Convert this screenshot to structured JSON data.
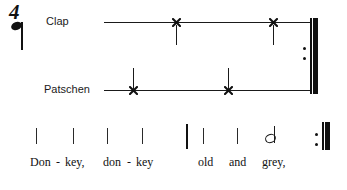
{
  "score": {
    "time_signature": {
      "numerator": "4",
      "beat_note": "quarter-note"
    },
    "parts": [
      {
        "label": "Clap",
        "label_x": 46,
        "line": {
          "x": 104,
          "y": 22,
          "width": 206
        },
        "stem_direction": "down",
        "notes": [
          {
            "symbol": "x-notehead",
            "x": 176,
            "y": 22
          },
          {
            "symbol": "x-notehead",
            "x": 273,
            "y": 22
          }
        ]
      },
      {
        "label": "Patschen",
        "label_x": 44,
        "line": {
          "x": 104,
          "y": 90,
          "width": 206
        },
        "stem_direction": "up",
        "notes": [
          {
            "symbol": "x-notehead",
            "x": 133,
            "y": 90
          },
          {
            "symbol": "x-notehead",
            "x": 228,
            "y": 90
          }
        ]
      }
    ],
    "percussion_repeat": {
      "x": 310,
      "y_top": 18,
      "y_bottom": 94,
      "type": "end-repeat"
    },
    "rhythm_row": {
      "ticks": [
        {
          "x": 36,
          "type": "beat"
        },
        {
          "x": 73,
          "type": "beat"
        },
        {
          "x": 107,
          "type": "beat"
        },
        {
          "x": 142,
          "type": "beat"
        },
        {
          "x": 186,
          "type": "barline"
        },
        {
          "x": 203,
          "type": "beat"
        },
        {
          "x": 237,
          "type": "beat"
        }
      ],
      "half_note": {
        "x": 265,
        "symbol": "half-note"
      },
      "repeat": {
        "x": 322,
        "type": "end-repeat"
      }
    },
    "lyrics": [
      {
        "text": "Don",
        "x": 30
      },
      {
        "text": "-",
        "x": 56
      },
      {
        "text": "key,",
        "x": 65
      },
      {
        "text": "don",
        "x": 103
      },
      {
        "text": "-",
        "x": 127
      },
      {
        "text": "key",
        "x": 136
      },
      {
        "text": "old",
        "x": 198
      },
      {
        "text": "and",
        "x": 229
      },
      {
        "text": "grey,",
        "x": 262
      }
    ]
  }
}
